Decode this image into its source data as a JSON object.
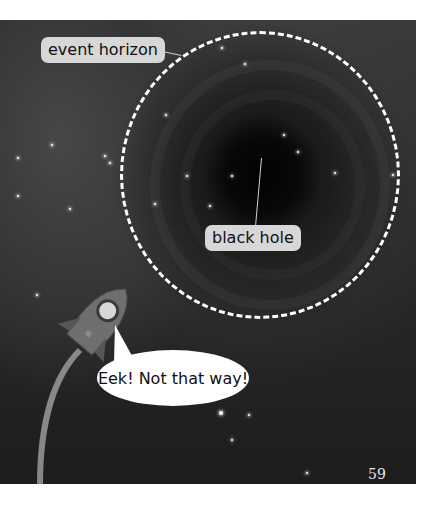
{
  "labels": {
    "event_horizon": "event horizon",
    "black_hole": "black hole"
  },
  "speech_bubble": {
    "text": "Eek! Not that way!"
  },
  "page_number": "59",
  "colors": {
    "background": "#2a2a2a",
    "label_bg": "#d7d7d7",
    "horizon_line": "#ffffff",
    "page_bg": "#ffffff"
  }
}
